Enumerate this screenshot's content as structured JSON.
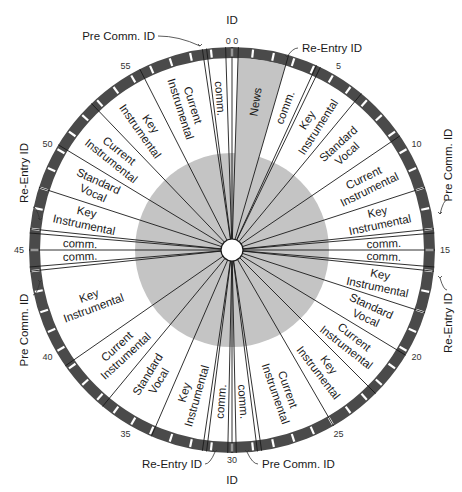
{
  "diagram": {
    "colors": {
      "ring": "#4a4a4a",
      "ring_gap": "#ffffff",
      "inner_disc": "#c4c4c4",
      "news_wedge": "#c4c4c4",
      "lines": "#1a1a1a",
      "background": "#ffffff"
    },
    "minute_labels": [
      {
        "value": "0",
        "minute": 0
      },
      {
        "value": "5",
        "minute": 5
      },
      {
        "value": "10",
        "minute": 10
      },
      {
        "value": "15",
        "minute": 15
      },
      {
        "value": "20",
        "minute": 20
      },
      {
        "value": "25",
        "minute": 25
      },
      {
        "value": "30",
        "minute": 30
      },
      {
        "value": "35",
        "minute": 35
      },
      {
        "value": "40",
        "minute": 40
      },
      {
        "value": "45",
        "minute": 45
      },
      {
        "value": "50",
        "minute": 50
      },
      {
        "value": "55",
        "minute": 55
      }
    ],
    "segments": [
      {
        "label": "News",
        "line2": "",
        "start": 0.3,
        "end": 2.7,
        "shaded": true
      },
      {
        "label": "comm.",
        "line2": "",
        "start": 2.7,
        "end": 4.1
      },
      {
        "label": "Key",
        "line2": "Instrumental",
        "start": 4.3,
        "end": 6.6
      },
      {
        "label": "Standard",
        "line2": "Vocal",
        "start": 6.6,
        "end": 9.3
      },
      {
        "label": "Current",
        "line2": "Instrumental",
        "start": 9.3,
        "end": 12.0
      },
      {
        "label": "Key",
        "line2": "Instrumental",
        "start": 12.0,
        "end": 14.0
      },
      {
        "label": "comm.",
        "line2": "",
        "start": 14.2,
        "end": 15.0
      },
      {
        "label": "comm.",
        "line2": "",
        "start": 15.0,
        "end": 15.8
      },
      {
        "label": "Key",
        "line2": "Instrumental",
        "start": 16.0,
        "end": 18.0
      },
      {
        "label": "Standard",
        "line2": "Vocal",
        "start": 18.0,
        "end": 20.2
      },
      {
        "label": "Current",
        "line2": "Instrumental",
        "start": 20.2,
        "end": 22.5
      },
      {
        "label": "Key",
        "line2": "Instrumental",
        "start": 22.5,
        "end": 25.0
      },
      {
        "label": "Current",
        "line2": "Instrumental",
        "start": 25.0,
        "end": 28.6
      },
      {
        "label": "comm.",
        "line2": "",
        "start": 28.8,
        "end": 29.8
      },
      {
        "label": "comm.",
        "line2": "",
        "start": 30.2,
        "end": 31.2
      },
      {
        "label": "Key",
        "line2": "Instrumental",
        "start": 31.4,
        "end": 33.9
      },
      {
        "label": "Standard",
        "line2": "Vocal",
        "start": 33.9,
        "end": 36.6
      },
      {
        "label": "Current",
        "line2": "Instrumental",
        "start": 36.6,
        "end": 39.2
      },
      {
        "label": "Key",
        "line2": "Instrumental",
        "start": 39.2,
        "end": 44.0
      },
      {
        "label": "comm.",
        "line2": "",
        "start": 44.2,
        "end": 45.0
      },
      {
        "label": "comm.",
        "line2": "",
        "start": 45.0,
        "end": 45.8
      },
      {
        "label": "Key",
        "line2": "Instrumental",
        "start": 46.0,
        "end": 48.0
      },
      {
        "label": "Standard",
        "line2": "Vocal",
        "start": 48.0,
        "end": 50.2
      },
      {
        "label": "Current",
        "line2": "Instrumental",
        "start": 50.2,
        "end": 52.7
      },
      {
        "label": "Key",
        "line2": "Instrumental",
        "start": 52.7,
        "end": 55.5
      },
      {
        "label": "Current",
        "line2": "Instrumental",
        "start": 55.5,
        "end": 58.6
      },
      {
        "label": "comm.",
        "line2": "",
        "start": 58.8,
        "end": 59.7
      }
    ],
    "boundary_minutes": [
      0,
      0.3,
      2.7,
      4.1,
      4.3,
      6.6,
      9.3,
      12.0,
      14.0,
      14.2,
      15.0,
      15.8,
      16.0,
      18.0,
      20.2,
      22.5,
      25.0,
      28.6,
      28.8,
      29.8,
      30.0,
      30.2,
      31.2,
      31.4,
      33.9,
      36.6,
      39.2,
      44.0,
      44.2,
      45.0,
      45.8,
      46.0,
      48.0,
      50.2,
      52.7,
      55.5,
      58.6,
      58.8,
      59.7
    ],
    "callouts": [
      {
        "text": "ID",
        "minute": 0,
        "position": "top"
      },
      {
        "text": "Pre Comm. ID",
        "minute": 58.7,
        "position": "top-left"
      },
      {
        "text": "Re-Entry ID",
        "minute": 4.2,
        "position": "top-right"
      },
      {
        "text": "Pre Comm. ID",
        "minute": 14.1,
        "position": "right-upper"
      },
      {
        "text": "Re-Entry ID",
        "minute": 15.9,
        "position": "right-lower"
      },
      {
        "text": "Pre Comm. ID",
        "minute": 28.7,
        "position": "bottom-right"
      },
      {
        "text": "ID",
        "minute": 30,
        "position": "bottom"
      },
      {
        "text": "Re-Entry ID",
        "minute": 31.3,
        "position": "bottom-left"
      },
      {
        "text": "Pre Comm. ID",
        "minute": 44.1,
        "position": "left-lower"
      },
      {
        "text": "Re-Entry ID",
        "minute": 45.9,
        "position": "left-upper"
      }
    ],
    "top_tick_text": "0|0",
    "bottom_tick_text": "30"
  }
}
